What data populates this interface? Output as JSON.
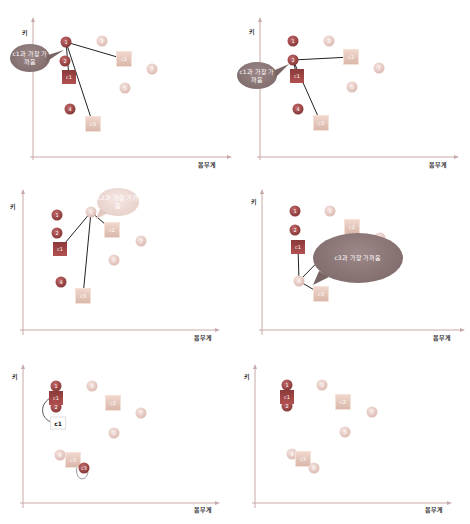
{
  "axes": {
    "y_label": "키",
    "x_label": "몸무게"
  },
  "colors": {
    "cluster1": "#8a3a3a",
    "other_points": "#dcbcb4",
    "centroid_light": "#e6c8bc",
    "bubble_dark": "#7a6565",
    "bubble_light": "#ecd6cf",
    "line": "#222222"
  },
  "panels": [
    {
      "id": 1,
      "callout": "c1과 가장 가까움",
      "highlight_point": "1",
      "points": [
        {
          "label": "1",
          "x": 66,
          "y": 42,
          "style": "dark"
        },
        {
          "label": "2",
          "x": 65,
          "y": 61,
          "style": "dark"
        },
        {
          "label": "3",
          "x": 102,
          "y": 41,
          "style": "light"
        },
        {
          "label": "4",
          "x": 70,
          "y": 109,
          "style": "dark"
        },
        {
          "label": "5",
          "x": 125,
          "y": 88,
          "style": "light"
        },
        {
          "label": "7",
          "x": 152,
          "y": 69,
          "style": "light"
        }
      ],
      "centroids": [
        {
          "label": "c1",
          "x": 69,
          "y": 77,
          "style": "dark"
        },
        {
          "label": "c2",
          "x": 124,
          "y": 59,
          "style": "light"
        },
        {
          "label": "c3",
          "x": 93,
          "y": 124,
          "style": "light"
        }
      ]
    },
    {
      "id": 2,
      "callout": "c1과 가장 가까움",
      "highlight_point": "2",
      "points": [
        {
          "label": "1",
          "x": 58,
          "y": 41,
          "style": "dark"
        },
        {
          "label": "2",
          "x": 58,
          "y": 60,
          "style": "dark"
        },
        {
          "label": "3",
          "x": 94,
          "y": 41,
          "style": "light"
        },
        {
          "label": "4",
          "x": 63,
          "y": 109,
          "style": "dark"
        },
        {
          "label": "5",
          "x": 117,
          "y": 87,
          "style": "light"
        },
        {
          "label": "7",
          "x": 144,
          "y": 68,
          "style": "light"
        }
      ],
      "centroids": [
        {
          "label": "c1",
          "x": 62,
          "y": 76,
          "style": "dark"
        },
        {
          "label": "c2",
          "x": 116,
          "y": 57,
          "style": "light"
        },
        {
          "label": "c3",
          "x": 86,
          "y": 123,
          "style": "light"
        }
      ]
    },
    {
      "id": 3,
      "callout": "c2과 가장 가까움",
      "highlight_point": "3",
      "points": [
        {
          "label": "1",
          "x": 57,
          "y": 40,
          "style": "dark"
        },
        {
          "label": "2",
          "x": 57,
          "y": 58,
          "style": "dark"
        },
        {
          "label": "3",
          "x": 91,
          "y": 37,
          "style": "light"
        },
        {
          "label": "4",
          "x": 61,
          "y": 107,
          "style": "dark"
        },
        {
          "label": "5",
          "x": 114,
          "y": 85,
          "style": "light"
        },
        {
          "label": "7",
          "x": 141,
          "y": 66,
          "style": "light"
        }
      ],
      "centroids": [
        {
          "label": "c1",
          "x": 60,
          "y": 74,
          "style": "dark"
        },
        {
          "label": "c2",
          "x": 112,
          "y": 55,
          "style": "light"
        },
        {
          "label": "c3",
          "x": 83,
          "y": 121,
          "style": "light"
        }
      ]
    },
    {
      "id": 4,
      "callout": "c3과 가장 가까움",
      "highlight_point": "4",
      "points": [
        {
          "label": "1",
          "x": 60,
          "y": 36,
          "style": "dark"
        },
        {
          "label": "2",
          "x": 60,
          "y": 55,
          "style": "dark"
        },
        {
          "label": "3",
          "x": 95,
          "y": 36,
          "style": "light"
        },
        {
          "label": "4",
          "x": 64,
          "y": 106,
          "style": "light"
        },
        {
          "label": "5",
          "x": 118,
          "y": 83,
          "style": "light"
        },
        {
          "label": "7",
          "x": 145,
          "y": 63,
          "style": "light"
        }
      ],
      "centroids": [
        {
          "label": "c1",
          "x": 63,
          "y": 72,
          "style": "dark"
        },
        {
          "label": "c2",
          "x": 117,
          "y": 52,
          "style": "light"
        },
        {
          "label": "c3",
          "x": 86,
          "y": 119,
          "style": "light"
        }
      ]
    },
    {
      "id": 5,
      "callout": "",
      "tag": "c1",
      "tag2": "c3",
      "points": [
        {
          "label": "1",
          "x": 56,
          "y": 36,
          "style": "dark"
        },
        {
          "label": "2",
          "x": 56,
          "y": 57,
          "style": "dark"
        },
        {
          "label": "3",
          "x": 92,
          "y": 36,
          "style": "light"
        },
        {
          "label": "4",
          "x": 60,
          "y": 105,
          "style": "light"
        },
        {
          "label": "5",
          "x": 114,
          "y": 83,
          "style": "light"
        },
        {
          "label": "7",
          "x": 141,
          "y": 63,
          "style": "light"
        },
        {
          "label": "6",
          "x": 84,
          "y": 118,
          "style": "dark"
        }
      ],
      "centroids": [
        {
          "label": "c1",
          "x": 56,
          "y": 48,
          "style": "dark"
        },
        {
          "label": "c2",
          "x": 113,
          "y": 53,
          "style": "light"
        },
        {
          "label": "c3",
          "x": 73,
          "y": 110,
          "style": "light"
        }
      ]
    },
    {
      "id": 6,
      "callout": "",
      "points": [
        {
          "label": "1",
          "x": 52,
          "y": 35,
          "style": "dark"
        },
        {
          "label": "2",
          "x": 52,
          "y": 56,
          "style": "dark"
        },
        {
          "label": "3",
          "x": 87,
          "y": 35,
          "style": "light"
        },
        {
          "label": "4",
          "x": 57,
          "y": 104,
          "style": "light"
        },
        {
          "label": "5",
          "x": 110,
          "y": 82,
          "style": "light"
        },
        {
          "label": "7",
          "x": 137,
          "y": 62,
          "style": "light"
        },
        {
          "label": "6",
          "x": 79,
          "y": 118,
          "style": "light"
        }
      ],
      "centroids": [
        {
          "label": "c1",
          "x": 52,
          "y": 47,
          "style": "dark"
        },
        {
          "label": "c2",
          "x": 108,
          "y": 52,
          "style": "light"
        },
        {
          "label": "c3",
          "x": 68,
          "y": 109,
          "style": "light"
        }
      ]
    }
  ]
}
